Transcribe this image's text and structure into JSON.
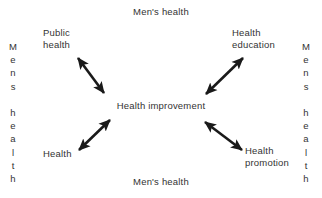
{
  "diagram": {
    "background_color": "#ffffff",
    "text_color": "#333333",
    "arrow_color": "#1a1a1a",
    "captions": {
      "top": "Men's health",
      "bottom": "Men's health",
      "left_chars": [
        "M",
        "e",
        "n",
        "s",
        "",
        "h",
        "e",
        "a",
        "l",
        "t",
        "h"
      ],
      "right_chars": [
        "M",
        "e",
        "n",
        "s",
        "",
        "h",
        "e",
        "a",
        "l",
        "t",
        "h"
      ],
      "left_text": "Mens health",
      "right_text": "Mens health"
    },
    "center": {
      "label": "Health improvement"
    },
    "nodes": [
      {
        "id": "public-health",
        "label": "Public\nhealth",
        "position": "top-left"
      },
      {
        "id": "health-education",
        "label": "Health\neducation",
        "position": "top-right"
      },
      {
        "id": "health",
        "label": "Health",
        "position": "bottom-left"
      },
      {
        "id": "health-promotion",
        "label": "Health\npromotion",
        "position": "bottom-right"
      }
    ],
    "connectors": [
      {
        "id": "arrow-public-health",
        "from": "public-health",
        "to": "health-improvement",
        "style": "double-headed",
        "direction": "diagonal-nwse"
      },
      {
        "id": "arrow-health-education",
        "from": "health-education",
        "to": "health-improvement",
        "style": "double-headed",
        "direction": "diagonal-nesw"
      },
      {
        "id": "arrow-health",
        "from": "health",
        "to": "health-improvement",
        "style": "double-headed",
        "direction": "diagonal-nesw"
      },
      {
        "id": "arrow-health-promotion",
        "from": "health-promotion",
        "to": "health-improvement",
        "style": "double-headed",
        "direction": "diagonal-nwse"
      }
    ]
  }
}
